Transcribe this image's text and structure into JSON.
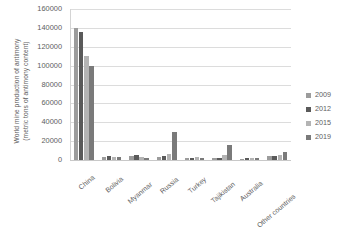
{
  "chart_data": {
    "type": "bar",
    "title": "",
    "xlabel": "",
    "ylabel": "World mine production of antimony (metric tons of antimony content)",
    "ylabel_line1": "World mine production of antimony",
    "ylabel_line2": "(metric tons of antimony content)",
    "ylim": [
      0,
      160000
    ],
    "ytick_step": 20000,
    "yticks": [
      "0",
      "20000",
      "40000",
      "60000",
      "80000",
      "100000",
      "120000",
      "140000",
      "160000"
    ],
    "ytick_values": [
      0,
      20000,
      40000,
      60000,
      80000,
      100000,
      120000,
      140000,
      160000
    ],
    "grid": true,
    "grid_axis": "y",
    "legend_position": "right",
    "categories": [
      "China",
      "Bolivia",
      "Myanmar",
      "Russia",
      "Turkey",
      "Tajikistan",
      "Australia",
      "Other countries"
    ],
    "series": [
      {
        "name": "2009",
        "color": "#9c9c9c",
        "values": [
          140000,
          3000,
          4000,
          3000,
          2400,
          2000,
          1500,
          4000
        ]
      },
      {
        "name": "2012",
        "color": "#5a5a5a",
        "values": [
          136000,
          4000,
          5000,
          4500,
          2300,
          2500,
          1800,
          4500
        ]
      },
      {
        "name": "2015",
        "color": "#b4b4b4",
        "values": [
          110000,
          3200,
          3000,
          6500,
          2800,
          5500,
          2200,
          5000
        ]
      },
      {
        "name": "2019",
        "color": "#7a7a7a",
        "values": [
          100000,
          3000,
          2000,
          30000,
          2400,
          16000,
          2500,
          9000
        ]
      }
    ]
  },
  "legend": {
    "items": [
      {
        "label": "2009"
      },
      {
        "label": "2012"
      },
      {
        "label": "2015"
      },
      {
        "label": "2019"
      }
    ]
  }
}
